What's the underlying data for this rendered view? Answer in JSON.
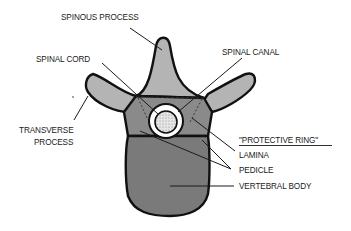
{
  "labels": {
    "spinous_process": "SPINOUS PROCESS",
    "spinal_cord": "SPINAL CORD",
    "spinal_canal": "SPINAL CANAL",
    "transverse_process_line1": "TRANSVERSE",
    "transverse_process_line2": "PROCESS",
    "protective_ring": "\"PROTECTIVE RING\"",
    "lamina": "LAMINA",
    "pedicle": "PEDICLE",
    "vertebral_body": "VERTEBRAL BODY"
  },
  "colors": {
    "light_gray": "#b4b4b4",
    "mid_gray": "#8a8a8a",
    "dark_gray": "#7a7a7a",
    "cord_fill": "#d8d8d8",
    "outline": "#111111"
  }
}
